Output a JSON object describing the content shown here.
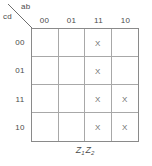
{
  "kmap": {
    "corner": {
      "row_var_label": "cd",
      "col_var_label": "ab"
    },
    "column_headers": [
      "00",
      "01",
      "11",
      "10"
    ],
    "row_headers": [
      "00",
      "01",
      "11",
      "10"
    ],
    "mark_symbol": "X",
    "cells": [
      [
        "",
        "",
        "X",
        ""
      ],
      [
        "",
        "",
        "X",
        ""
      ],
      [
        "",
        "",
        "X",
        "X"
      ],
      [
        "",
        "",
        "X",
        "X"
      ]
    ],
    "output_label": {
      "term1_base": "Z",
      "term1_sub": "1",
      "term2_base": "Z",
      "term2_sub": "2"
    },
    "colors": {
      "outer_border": "#8a8a8a",
      "inner_line": "#a8a8a8",
      "text": "#4a4a4a",
      "mark": "#6e6e6e",
      "background": "#ffffff"
    }
  }
}
